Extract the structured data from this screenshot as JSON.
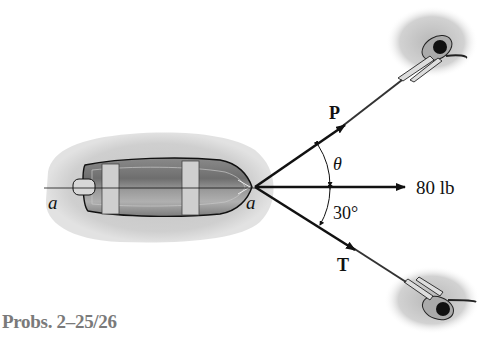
{
  "diagram": {
    "caption": "Probs. 2–25/26",
    "labels": {
      "point_left": "a",
      "point_right": "a",
      "force_p": "P",
      "force_t": "T",
      "angle_theta": "θ",
      "angle_30": "30°",
      "resultant": "80 lb"
    },
    "elements": {
      "boat": "boat-top-view",
      "left_person": "person-pulling-rope-top",
      "right_person": "person-pulling-rope-bottom"
    },
    "colors": {
      "water_shadow": "#c8c8c8",
      "line": "#111111",
      "caption": "#7a7a7a"
    }
  }
}
